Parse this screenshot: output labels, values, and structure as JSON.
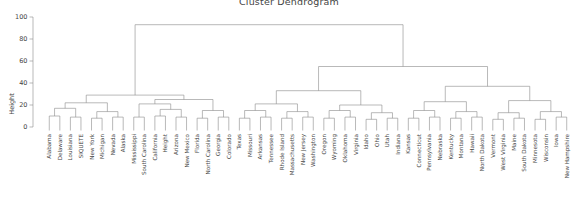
{
  "title": "Cluster Dendrogram",
  "axis": {
    "ylabel": "Height",
    "ticks": [
      0,
      20,
      40,
      60,
      80,
      100
    ],
    "ymin": 0,
    "ymax": 100
  },
  "colors": {
    "line": "#8a8a8a",
    "text": "#444444",
    "background": "#ffffff"
  },
  "chart_data": {
    "type": "dendrogram",
    "title": "Cluster Dendrogram",
    "xlabel": "",
    "ylabel": "Height",
    "ylim": [
      0,
      100
    ],
    "yticks": [
      0,
      20,
      40,
      60,
      80,
      100
    ],
    "grid": false,
    "legend": null,
    "orientation": "vertical",
    "n_leaves": 50,
    "leaf_labels": [
      "Alabama",
      "Delaware",
      "Louisiana",
      "SIQUETE",
      "New York",
      "Michigan",
      "Nevada",
      "Alaska",
      "Mississippi",
      "South Carolina",
      "California",
      "Height",
      "Arizona",
      "New Mexico",
      "Florida",
      "North Carolina",
      "Georgia",
      "Colorado",
      "Texas",
      "Missouri",
      "Arkansas",
      "Tennessee",
      "Rhode Island",
      "Massachusetts",
      "New Jersey",
      "Washington",
      "Oregon",
      "Wyoming",
      "Oklahoma",
      "Virginia",
      "Idaho",
      "Ohio",
      "Utah",
      "Indiana",
      "Kansas",
      "Connecticut",
      "Pennsylvania",
      "Nebraska",
      "Kentucky",
      "Montana",
      "Hawaii",
      "North Dakota",
      "Vermont",
      "West Virginia",
      "Maine",
      "South Dakota",
      "Minnesota",
      "Wisconsin",
      "Iowa",
      "New Hampshire"
    ],
    "merges": [
      {
        "id": "m1",
        "left": {
          "leaf": 0
        },
        "right": {
          "leaf": 1
        },
        "height": 10
      },
      {
        "id": "m2",
        "left": {
          "leaf": 2
        },
        "right": {
          "leaf": 3
        },
        "height": 9
      },
      {
        "id": "m3",
        "left": {
          "node": "m1"
        },
        "right": {
          "node": "m2"
        },
        "height": 17
      },
      {
        "id": "m4",
        "left": {
          "leaf": 4
        },
        "right": {
          "leaf": 5
        },
        "height": 8
      },
      {
        "id": "m5",
        "left": {
          "leaf": 6
        },
        "right": {
          "leaf": 7
        },
        "height": 9
      },
      {
        "id": "m6",
        "left": {
          "node": "m4"
        },
        "right": {
          "node": "m5"
        },
        "height": 14
      },
      {
        "id": "m7",
        "left": {
          "node": "m3"
        },
        "right": {
          "node": "m6"
        },
        "height": 22
      },
      {
        "id": "m8",
        "left": {
          "leaf": 8
        },
        "right": {
          "leaf": 9
        },
        "height": 9
      },
      {
        "id": "m9",
        "left": {
          "leaf": 10
        },
        "right": {
          "leaf": 11
        },
        "height": 10
      },
      {
        "id": "m10",
        "left": {
          "leaf": 12
        },
        "right": {
          "leaf": 13
        },
        "height": 9
      },
      {
        "id": "m11",
        "left": {
          "node": "m9"
        },
        "right": {
          "node": "m10"
        },
        "height": 16
      },
      {
        "id": "m12",
        "left": {
          "node": "m8"
        },
        "right": {
          "node": "m11"
        },
        "height": 21
      },
      {
        "id": "m13",
        "left": {
          "leaf": 14
        },
        "right": {
          "leaf": 15
        },
        "height": 8
      },
      {
        "id": "m14",
        "left": {
          "leaf": 16
        },
        "right": {
          "leaf": 17
        },
        "height": 9
      },
      {
        "id": "m15",
        "left": {
          "node": "m13"
        },
        "right": {
          "node": "m14"
        },
        "height": 15
      },
      {
        "id": "m16",
        "left": {
          "node": "m12"
        },
        "right": {
          "node": "m15"
        },
        "height": 25
      },
      {
        "id": "m17",
        "left": {
          "node": "m7"
        },
        "right": {
          "node": "m16"
        },
        "height": 29
      },
      {
        "id": "m18",
        "left": {
          "leaf": 18
        },
        "right": {
          "leaf": 19
        },
        "height": 8
      },
      {
        "id": "m19",
        "left": {
          "leaf": 20
        },
        "right": {
          "leaf": 21
        },
        "height": 9
      },
      {
        "id": "m20",
        "left": {
          "node": "m18"
        },
        "right": {
          "node": "m19"
        },
        "height": 15
      },
      {
        "id": "m21",
        "left": {
          "leaf": 22
        },
        "right": {
          "leaf": 23
        },
        "height": 8
      },
      {
        "id": "m22",
        "left": {
          "leaf": 24
        },
        "right": {
          "leaf": 25
        },
        "height": 9
      },
      {
        "id": "m23",
        "left": {
          "node": "m21"
        },
        "right": {
          "node": "m22"
        },
        "height": 14
      },
      {
        "id": "m24",
        "left": {
          "node": "m20"
        },
        "right": {
          "node": "m23"
        },
        "height": 21
      },
      {
        "id": "m25",
        "left": {
          "leaf": 26
        },
        "right": {
          "leaf": 27
        },
        "height": 8
      },
      {
        "id": "m26",
        "left": {
          "leaf": 28
        },
        "right": {
          "leaf": 29
        },
        "height": 9
      },
      {
        "id": "m27",
        "left": {
          "node": "m25"
        },
        "right": {
          "node": "m26"
        },
        "height": 15
      },
      {
        "id": "m28",
        "left": {
          "leaf": 30
        },
        "right": {
          "leaf": 31
        },
        "height": 7
      },
      {
        "id": "m29",
        "left": {
          "leaf": 32
        },
        "right": {
          "leaf": 33
        },
        "height": 8
      },
      {
        "id": "m30",
        "left": {
          "node": "m28"
        },
        "right": {
          "node": "m29"
        },
        "height": 13
      },
      {
        "id": "m31",
        "left": {
          "node": "m27"
        },
        "right": {
          "node": "m30"
        },
        "height": 20
      },
      {
        "id": "m32",
        "left": {
          "node": "m24"
        },
        "right": {
          "node": "m31"
        },
        "height": 33
      },
      {
        "id": "m33",
        "left": {
          "leaf": 34
        },
        "right": {
          "leaf": 35
        },
        "height": 8
      },
      {
        "id": "m34",
        "left": {
          "leaf": 36
        },
        "right": {
          "leaf": 37
        },
        "height": 9
      },
      {
        "id": "m35",
        "left": {
          "node": "m33"
        },
        "right": {
          "node": "m34"
        },
        "height": 15
      },
      {
        "id": "m36",
        "left": {
          "leaf": 38
        },
        "right": {
          "leaf": 39
        },
        "height": 8
      },
      {
        "id": "m37",
        "left": {
          "leaf": 40
        },
        "right": {
          "leaf": 41
        },
        "height": 9
      },
      {
        "id": "m38",
        "left": {
          "node": "m36"
        },
        "right": {
          "node": "m37"
        },
        "height": 14
      },
      {
        "id": "m39",
        "left": {
          "node": "m35"
        },
        "right": {
          "node": "m38"
        },
        "height": 23
      },
      {
        "id": "m40",
        "left": {
          "leaf": 42
        },
        "right": {
          "leaf": 43
        },
        "height": 7
      },
      {
        "id": "m41",
        "left": {
          "leaf": 44
        },
        "right": {
          "leaf": 45
        },
        "height": 8
      },
      {
        "id": "m42",
        "left": {
          "node": "m40"
        },
        "right": {
          "node": "m41"
        },
        "height": 13
      },
      {
        "id": "m43",
        "left": {
          "leaf": 46
        },
        "right": {
          "leaf": 47
        },
        "height": 7
      },
      {
        "id": "m44",
        "left": {
          "leaf": 48
        },
        "right": {
          "leaf": 49
        },
        "height": 9
      },
      {
        "id": "m45",
        "left": {
          "node": "m43"
        },
        "right": {
          "node": "m44"
        },
        "height": 14
      },
      {
        "id": "m46",
        "left": {
          "node": "m42"
        },
        "right": {
          "node": "m45"
        },
        "height": 24
      },
      {
        "id": "m47",
        "left": {
          "node": "m39"
        },
        "right": {
          "node": "m46"
        },
        "height": 37
      },
      {
        "id": "m48",
        "left": {
          "node": "m32"
        },
        "right": {
          "node": "m47"
        },
        "height": 55
      },
      {
        "id": "m49",
        "left": {
          "node": "m17"
        },
        "right": {
          "node": "m48"
        },
        "height": 93
      }
    ]
  }
}
